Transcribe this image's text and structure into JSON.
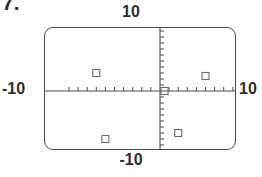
{
  "problem": {
    "number": "7."
  },
  "screen": {
    "window_labels": {
      "ymax": "10",
      "ymin": "-10",
      "xmin": "-10",
      "xmax": "10"
    },
    "axis_color": "#4a4a52",
    "frame_color": "#4a4a52",
    "marker_color": "#6b6b73",
    "background": "#ffffff"
  },
  "chart_data": {
    "type": "scatter",
    "title": "",
    "xlabel": "",
    "ylabel": "",
    "xlim": [
      -10,
      10
    ],
    "ylim": [
      -10,
      10
    ],
    "xtick_interval": 1,
    "ytick_interval": 1,
    "grid": false,
    "legend": null,
    "axis_labels": {
      "top": "10",
      "bottom": "-10",
      "left": "-10",
      "right": "10"
    },
    "marker_style": "open-square",
    "points": [
      {
        "x": -7,
        "y": 3
      },
      {
        "x": 5,
        "y": 2.5
      },
      {
        "x": 0.5,
        "y": 0
      },
      {
        "x": -6,
        "y": -8
      },
      {
        "x": 2,
        "y": -7
      }
    ]
  }
}
